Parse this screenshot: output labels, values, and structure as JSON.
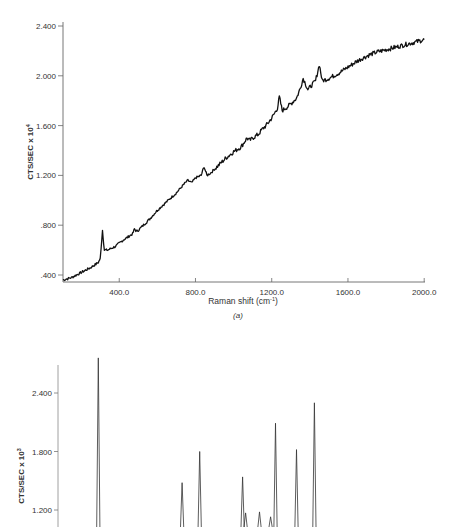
{
  "chart_data": [
    {
      "id": "a",
      "type": "line",
      "title": "",
      "caption": "(a)",
      "xlabel": "Raman shift (cm-1)",
      "xlabel_main": "Raman shift (cm",
      "xlabel_sup": "-1",
      "xlabel_close": ")",
      "ylabel_main": "CTS/SEC x 10",
      "ylabel_sup": "4",
      "xlim": [
        105,
        2000
      ],
      "ylim": [
        0.35,
        2.45
      ],
      "xticks": [
        400.0,
        800.0,
        1200.0,
        1600.0,
        2000.0
      ],
      "xtick_labels": [
        "400.0",
        "800.0",
        "1200.0",
        "1600.0",
        "2000.0"
      ],
      "yticks": [
        0.4,
        0.8,
        1.2,
        1.6,
        2.0,
        2.4
      ],
      "ytick_labels": [
        ".400",
        ".800",
        "1.200",
        "1.600",
        "2.000",
        "2.400"
      ],
      "grid": false,
      "series": [
        {
          "name": "spectrum (a)",
          "x": [
            105,
            150,
            200,
            250,
            290,
            300,
            305,
            312,
            322,
            340,
            380,
            420,
            470,
            480,
            490,
            500,
            520,
            560,
            600,
            650,
            700,
            740,
            760,
            780,
            800,
            830,
            845,
            860,
            880,
            920,
            960,
            1000,
            1040,
            1070,
            1085,
            1100,
            1130,
            1150,
            1170,
            1200,
            1230,
            1240,
            1255,
            1290,
            1330,
            1350,
            1365,
            1390,
            1430,
            1450,
            1465,
            1500,
            1550,
            1600,
            1650,
            1700,
            1750,
            1800,
            1850,
            1900,
            1950,
            2000
          ],
          "y": [
            0.36,
            0.38,
            0.42,
            0.46,
            0.5,
            0.53,
            0.62,
            0.76,
            0.6,
            0.6,
            0.63,
            0.68,
            0.73,
            0.77,
            0.75,
            0.76,
            0.79,
            0.85,
            0.92,
            0.99,
            1.06,
            1.13,
            1.16,
            1.14,
            1.18,
            1.2,
            1.27,
            1.2,
            1.22,
            1.28,
            1.34,
            1.39,
            1.43,
            1.5,
            1.48,
            1.5,
            1.53,
            1.57,
            1.6,
            1.66,
            1.74,
            1.83,
            1.72,
            1.76,
            1.82,
            1.9,
            1.98,
            1.89,
            1.96,
            2.09,
            1.96,
            1.98,
            2.02,
            2.07,
            2.12,
            2.16,
            2.19,
            2.21,
            2.23,
            2.25,
            2.27,
            2.29
          ]
        }
      ],
      "peaks_cm1": [
        315,
        490,
        850,
        1070,
        1240,
        1365,
        1450
      ]
    },
    {
      "id": "b",
      "type": "line",
      "title": "",
      "caption": "",
      "xlabel": "",
      "ylabel_main": "CTS/SEC x 10",
      "ylabel_sup": "3",
      "ylim": [
        1.1,
        2.8
      ],
      "yticks": [
        1.2,
        1.8,
        2.4
      ],
      "ytick_labels": [
        "1.200",
        "1.800",
        "2.400"
      ],
      "grid": false,
      "series": [
        {
          "name": "spectrum (b)",
          "peaks": [
            {
              "x": 290,
              "y": 2.76
            },
            {
              "x": 730,
              "y": 1.48
            },
            {
              "x": 822,
              "y": 1.8
            },
            {
              "x": 1047,
              "y": 1.54
            },
            {
              "x": 1063,
              "y": 1.17
            },
            {
              "x": 1136,
              "y": 1.18
            },
            {
              "x": 1194,
              "y": 1.13
            },
            {
              "x": 1220,
              "y": 2.09
            },
            {
              "x": 1330,
              "y": 1.82
            },
            {
              "x": 1424,
              "y": 2.3
            }
          ]
        }
      ]
    }
  ]
}
